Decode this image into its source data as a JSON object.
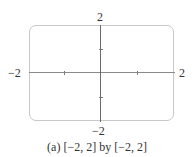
{
  "figure": {
    "window": {
      "xmin": -2,
      "xmax": 2,
      "ymin": -2,
      "ymax": 2
    },
    "labels": {
      "y_top": "2",
      "y_bottom": "−2",
      "x_left": "−2",
      "x_right": "2"
    },
    "ticks": {
      "x": [
        -1,
        1
      ],
      "y": [
        -1,
        1
      ]
    },
    "caption": "(a) [−2, 2] by [−2, 2]"
  },
  "colors": {
    "frame": "#c8c8c8",
    "axes": "#7a7a7a",
    "text": "#333333"
  }
}
